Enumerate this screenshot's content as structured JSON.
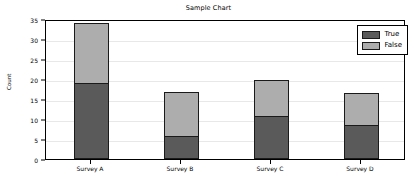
{
  "chart_data": {
    "type": "bar",
    "stacked": true,
    "title": "Sample Chart",
    "xlabel": "",
    "ylabel": "Count",
    "categories": [
      "Survey A",
      "Survey B",
      "Survey C",
      "Survey D"
    ],
    "series": [
      {
        "name": "True",
        "color": "#5a5a5a",
        "values": [
          19.0,
          5.8,
          10.8,
          8.5
        ]
      },
      {
        "name": "False",
        "color": "#adadad",
        "values": [
          15.0,
          10.9,
          8.9,
          7.9
        ]
      }
    ],
    "totals": [
      34.0,
      16.7,
      19.7,
      16.4
    ],
    "ylim": [
      0,
      35
    ],
    "yticks": [
      0,
      5,
      10,
      15,
      20,
      25,
      30,
      35
    ],
    "ytick_labels": [
      "0",
      "5",
      "10",
      "15",
      "20",
      "25",
      "30",
      "35"
    ],
    "grid": true,
    "grid_axis": "y",
    "legend_position": "upper right",
    "legend_entries": [
      "True",
      "False"
    ],
    "bar_edge_color": "#1a1a1a",
    "axes_color": "#000000",
    "grid_color": "#e8e8e8",
    "background": "#ffffff"
  }
}
